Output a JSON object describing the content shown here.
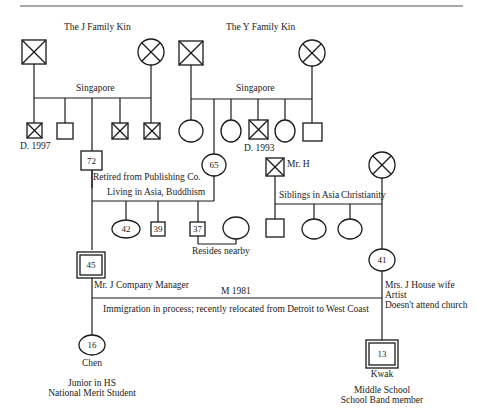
{
  "header_text": "",
  "families": {
    "j_family": {
      "title": "The J Family Kin",
      "place": "Singapore"
    },
    "y_family": {
      "title": "The Y Family Kin",
      "place": "Singapore"
    }
  },
  "j_siblings": [
    {
      "sex": "male",
      "deceased": true,
      "note": "D. 1997"
    },
    {
      "sex": "male",
      "deceased": false,
      "note": ""
    },
    {
      "sex": "male",
      "deceased": false,
      "note": "",
      "is_parent": true
    },
    {
      "sex": "male",
      "deceased": true,
      "note": ""
    },
    {
      "sex": "male",
      "deceased": true,
      "note": ""
    }
  ],
  "y_siblings": [
    {
      "sex": "female",
      "deceased": false,
      "note": ""
    },
    {
      "sex": "female",
      "deceased": false,
      "note": "",
      "is_parent": true
    },
    {
      "sex": "female",
      "deceased": false,
      "note": ""
    },
    {
      "sex": "male",
      "deceased": true,
      "note": "D. 1993"
    },
    {
      "sex": "female",
      "deceased": false,
      "note": ""
    },
    {
      "sex": "male",
      "deceased": false,
      "note": ""
    }
  ],
  "grandfather": {
    "age": "72",
    "note": "Retired from Publishing Co."
  },
  "grandmother": {
    "age": "65"
  },
  "grandparents_note": "Living in Asia, Buddhism",
  "paternal_siblings": [
    {
      "sex": "female",
      "age": "42"
    },
    {
      "sex": "male",
      "age": "39"
    },
    {
      "sex": "male",
      "age": "37",
      "spouse": "female",
      "note": "Resides nearby"
    }
  ],
  "maternal_parents": {
    "father": {
      "label": "Mr. H",
      "deceased": true
    },
    "mother": {
      "deceased": true
    },
    "siblings_note": "Siblings in Asia",
    "religion_note": "Christianity",
    "siblings": [
      "male",
      "female",
      "female"
    ]
  },
  "father": {
    "age": "45",
    "note": "Mr. J Company Manager"
  },
  "mother": {
    "age": "41",
    "notes": [
      "Mrs. J House wife",
      "Artist",
      "Doesn't attend church"
    ]
  },
  "marriage": {
    "label": "M 1981",
    "note": "Immigration in process; recently relocated from Detroit to West Coast"
  },
  "children": [
    {
      "name": "Chen",
      "age": "16",
      "sex": "female",
      "notes": [
        "Junior in HS",
        "National Merit Student"
      ]
    },
    {
      "name": "Kwak",
      "age": "13",
      "sex": "male",
      "identified_patient": true,
      "notes": [
        "Middle School",
        "School Band member"
      ]
    }
  ],
  "colors": {
    "line": "#1a1a1a",
    "background": "#ffffff",
    "header_rule": "#555555"
  }
}
